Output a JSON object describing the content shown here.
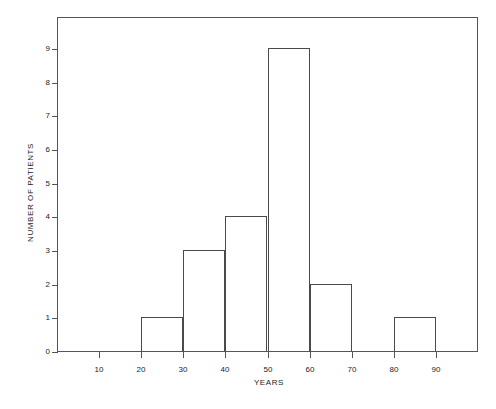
{
  "chart_data": {
    "type": "bar",
    "title": "",
    "subtitle": "",
    "xlabel": "YEARS",
    "ylabel": "NUMBER OF PATIENTS",
    "xlim": [
      0,
      100
    ],
    "ylim": [
      0,
      9.95
    ],
    "grid": false,
    "legend": null,
    "bin_width": 10,
    "x_ticks": [
      10,
      20,
      30,
      40,
      50,
      60,
      70,
      80,
      90
    ],
    "x_tick_labels": [
      "10",
      "20",
      "30",
      "40",
      "50",
      "60",
      "70",
      "80",
      "90"
    ],
    "y_ticks": [
      0,
      1,
      2,
      3,
      4,
      5,
      6,
      7,
      8,
      9
    ],
    "y_tick_labels": [
      "0",
      "1",
      "2",
      "3",
      "4",
      "5",
      "6",
      "7",
      "8",
      "9"
    ],
    "bins": [
      {
        "label": "10-20",
        "start": 10,
        "end": 20,
        "value": 0
      },
      {
        "label": "20-30",
        "start": 20,
        "end": 30,
        "value": 1
      },
      {
        "label": "30-40",
        "start": 30,
        "end": 40,
        "value": 3
      },
      {
        "label": "40-50",
        "start": 40,
        "end": 50,
        "value": 4
      },
      {
        "label": "50-60",
        "start": 50,
        "end": 60,
        "value": 9
      },
      {
        "label": "60-70",
        "start": 60,
        "end": 70,
        "value": 2
      },
      {
        "label": "70-80",
        "start": 70,
        "end": 80,
        "value": 0
      },
      {
        "label": "80-90",
        "start": 80,
        "end": 90,
        "value": 1
      }
    ],
    "categories": [
      "10-20",
      "20-30",
      "30-40",
      "40-50",
      "50-60",
      "60-70",
      "70-80",
      "80-90"
    ],
    "values": [
      0,
      1,
      3,
      4,
      9,
      2,
      0,
      1
    ],
    "total": 20
  },
  "style": {
    "background": "#ffffff",
    "line_color": "#4a4a4a",
    "axis_color": "#555555",
    "text_color": "#1c1c1c",
    "bar_fill": "none"
  }
}
